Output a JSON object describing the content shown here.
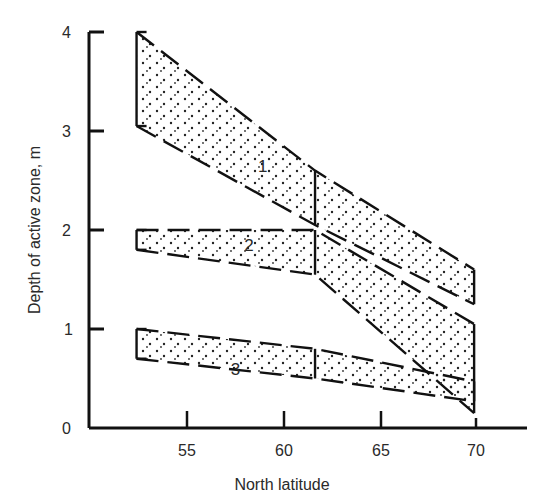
{
  "chart_data": {
    "type": "area",
    "title": "",
    "xlabel": "North latitude",
    "ylabel": "Depth of active zone, m",
    "xlim": [
      50,
      72
    ],
    "ylim": [
      0,
      4
    ],
    "x_ticks": [
      55,
      60,
      65,
      70
    ],
    "y_ticks": [
      0,
      1,
      2,
      3,
      4
    ],
    "grid": false,
    "legend": "none (bands labeled inline 1, 2, 3)",
    "series": [
      {
        "name": "1",
        "x": [
          52.4,
          61.6,
          69.8
        ],
        "lower": [
          3.05,
          2.05,
          1.25
        ],
        "upper": [
          4.0,
          2.6,
          1.6
        ],
        "label_pos": [
          58.9,
          2.65
        ]
      },
      {
        "name": "2",
        "x": [
          52.4,
          61.6,
          69.8
        ],
        "lower": [
          1.8,
          1.55,
          0.15
        ],
        "upper": [
          2.0,
          2.0,
          1.05
        ],
        "label_pos": [
          58.2,
          1.85
        ]
      },
      {
        "name": "3",
        "x": [
          52.4,
          61.6,
          69.8
        ],
        "lower": [
          0.7,
          0.5,
          0.27
        ],
        "upper": [
          1.0,
          0.8,
          0.47
        ],
        "label_pos": [
          57.5,
          0.6
        ]
      }
    ]
  },
  "axes": {
    "x_title": "North latitude",
    "y_title": "Depth of active zone, m",
    "x_tick_labels": [
      "55",
      "60",
      "65",
      "70"
    ],
    "y_tick_labels": [
      "0",
      "1",
      "2",
      "3",
      "4"
    ]
  },
  "bands": {
    "label_1": "1",
    "label_2": "2",
    "label_3": "3"
  }
}
